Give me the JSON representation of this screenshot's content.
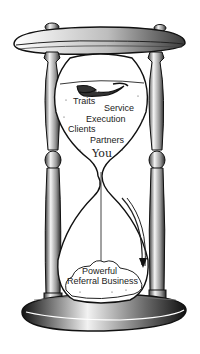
{
  "illustration": {
    "subject": "hourglass",
    "top_labels": {
      "traits": "Traits",
      "service": "Service",
      "execution": "Execution",
      "clients": "Clients",
      "partners": "Partners",
      "you": "You"
    },
    "bottom_label": {
      "line1": "Powerful",
      "line2": "Referral Business"
    },
    "colors": {
      "ink": "#1a1a1a",
      "background": "#ffffff",
      "shade": "#6e6e6e"
    }
  }
}
